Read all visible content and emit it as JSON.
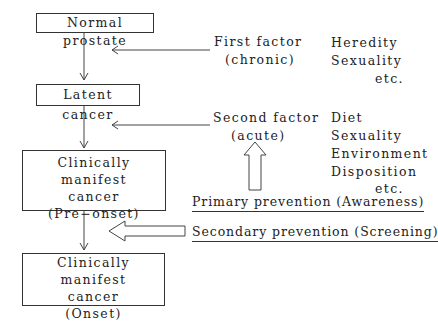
{
  "stages": [
    {
      "lines": [
        "Normal prostate"
      ]
    },
    {
      "lines": [
        "Latent cancer"
      ]
    },
    {
      "lines": [
        "Clinically manifest",
        "cancer",
        "(Pre−onset)"
      ]
    },
    {
      "lines": [
        "Clinically manifest",
        "cancer",
        "(Onset)"
      ]
    }
  ],
  "factors": [
    {
      "title": "First factor",
      "subtitle": "(chronic)",
      "examples": [
        "Heredity",
        "Sexuality",
        "etc."
      ]
    },
    {
      "title": "Second factor",
      "subtitle": "(acute)",
      "examples": [
        "Diet",
        "Sexuality",
        "Environment",
        "Disposition",
        "etc."
      ]
    }
  ],
  "prevention": {
    "primary": "Primary prevention (Awareness)",
    "secondary": "Secondary prevention (Screening)"
  }
}
